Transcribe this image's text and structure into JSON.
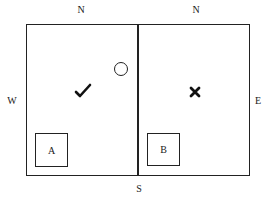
{
  "diagram": {
    "compass": {
      "north_left": "N",
      "north_right": "N",
      "west": "W",
      "east": "E",
      "south": "S"
    },
    "rooms": [
      {
        "name": "left-room",
        "box_label": "A",
        "marker": "checkmark",
        "extra": "circle"
      },
      {
        "name": "right-room",
        "box_label": "B",
        "marker": "cross"
      }
    ],
    "boxes": {
      "a": "A",
      "b": "B"
    },
    "colors": {
      "line": "#222222",
      "background": "#ffffff"
    }
  }
}
